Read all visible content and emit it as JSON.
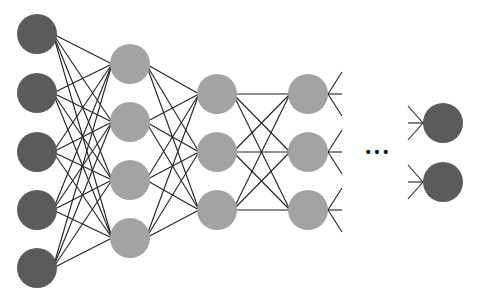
{
  "diagram": {
    "type": "feedforward-neural-network",
    "colors": {
      "dark_node": "#5b5b5b",
      "light_node": "#a3a3a3",
      "edge": "#222222",
      "background": "#ffffff"
    },
    "node_radius": 20,
    "layers": [
      {
        "name": "input-layer",
        "x": 37,
        "ys": [
          34,
          93,
          152,
          210,
          268
        ],
        "color": "dark"
      },
      {
        "name": "hidden-layer-1",
        "x": 130,
        "ys": [
          64,
          122,
          180,
          238
        ],
        "color": "light"
      },
      {
        "name": "hidden-layer-2",
        "x": 217,
        "ys": [
          94,
          152,
          210
        ],
        "color": "light"
      },
      {
        "name": "hidden-layer-3",
        "x": 308,
        "ys": [
          94,
          152,
          210
        ],
        "color": "light"
      },
      {
        "name": "output-layer",
        "x": 443,
        "ys": [
          123,
          182
        ],
        "color": "dark"
      }
    ],
    "ellipsis": "• • •"
  }
}
